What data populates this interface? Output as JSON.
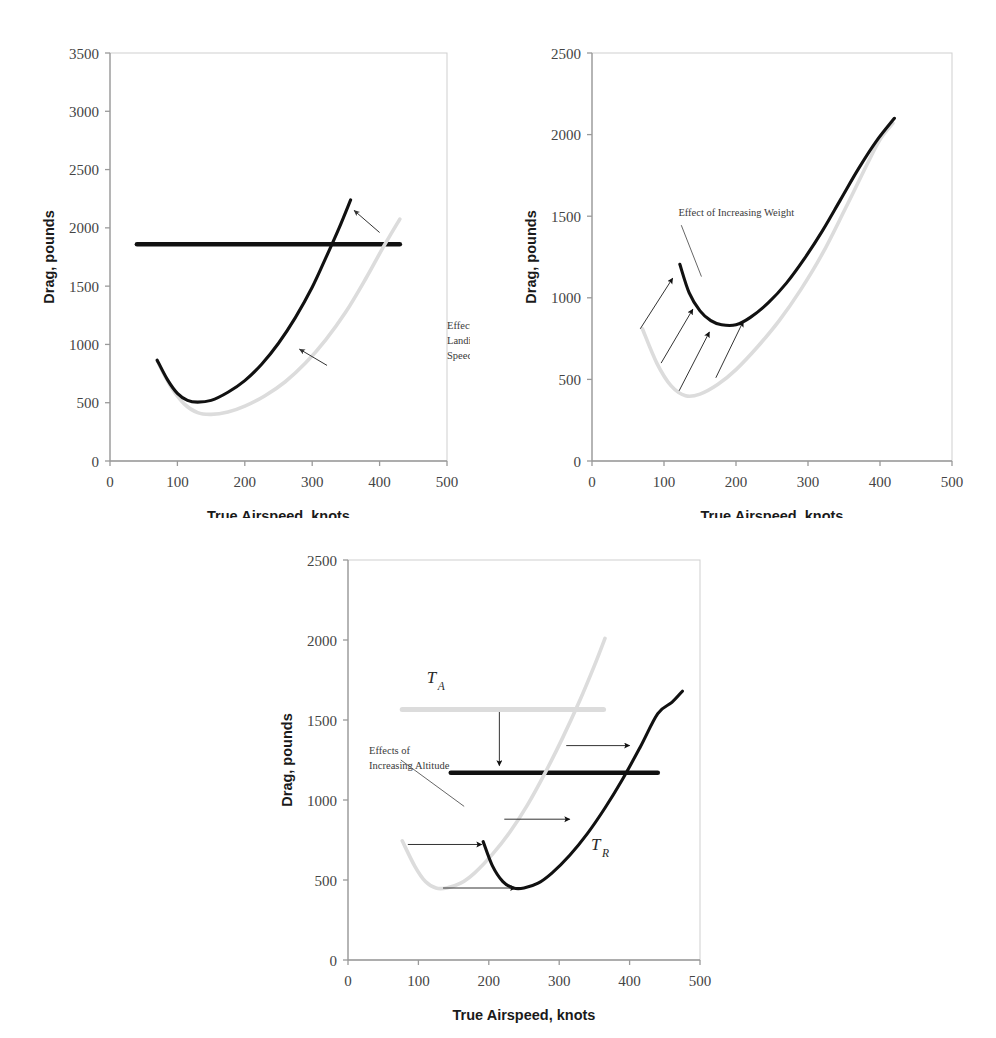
{
  "figure": {
    "background": "#ffffff",
    "colors": {
      "curve_dark": "#111111",
      "curve_light": "#dcdcdc",
      "axis": "#9a9a9a",
      "text": "#3a3a3a",
      "arrow": "#333333"
    }
  },
  "chart_data": [
    {
      "id": "chart-landing-gear",
      "type": "line",
      "title": "",
      "xlabel": "True Airspeed, knots",
      "ylabel": "Drag, pounds",
      "xlim": [
        0,
        500
      ],
      "ylim": [
        0,
        3500
      ],
      "xticks": [
        0,
        100,
        200,
        300,
        400,
        500
      ],
      "yticks": [
        0,
        500,
        1000,
        1500,
        2000,
        2500,
        3000,
        3500
      ],
      "grid": false,
      "legend": "none",
      "series": [
        {
          "name": "Thrust available (horizontal line)",
          "style": "dark-thick-horizontal",
          "x": [
            40,
            430
          ],
          "y": [
            1860,
            1860
          ]
        },
        {
          "name": "Drag, clean configuration",
          "style": "light",
          "x": [
            70,
            90,
            110,
            130,
            150,
            175,
            200,
            230,
            260,
            290,
            320,
            350,
            380,
            405,
            430
          ],
          "y": [
            860,
            640,
            490,
            415,
            400,
            420,
            470,
            560,
            680,
            840,
            1040,
            1280,
            1570,
            1830,
            2075
          ]
        },
        {
          "name": "Drag, gear or speed brakes extended",
          "style": "dark",
          "x": [
            70,
            85,
            100,
            115,
            130,
            150,
            175,
            200,
            225,
            250,
            275,
            300,
            320,
            340,
            357
          ],
          "y": [
            865,
            700,
            580,
            520,
            505,
            520,
            590,
            690,
            830,
            1010,
            1230,
            1490,
            1740,
            2000,
            2240
          ]
        }
      ],
      "annotations": [
        {
          "name": "effect-note",
          "text_lines": [
            "Effect of Extending",
            "Landing Gear or",
            "Speed Brakes"
          ],
          "x": 500,
          "y": 1130
        }
      ],
      "arrows": [
        {
          "name": "arrow-upper",
          "from_x": 400,
          "from_y": 1960,
          "to_x": 362,
          "to_y": 2150
        },
        {
          "name": "arrow-lower",
          "from_x": 322,
          "from_y": 820,
          "to_x": 281,
          "to_y": 960
        }
      ]
    },
    {
      "id": "chart-increasing-weight",
      "type": "line",
      "title": "",
      "xlabel": "True Airspeed, knots",
      "ylabel": "Drag, pounds",
      "xlim": [
        0,
        500
      ],
      "ylim": [
        0,
        2500
      ],
      "xticks": [
        0,
        100,
        200,
        300,
        400,
        500
      ],
      "yticks": [
        0,
        500,
        1000,
        1500,
        2000,
        2500
      ],
      "grid": false,
      "legend": "none",
      "series": [
        {
          "name": "Drag, lower weight",
          "style": "light",
          "x": [
            70,
            90,
            110,
            130,
            150,
            175,
            200,
            230,
            260,
            290,
            320,
            350,
            380,
            400,
            418
          ],
          "y": [
            810,
            600,
            460,
            400,
            410,
            470,
            560,
            700,
            860,
            1050,
            1270,
            1530,
            1800,
            1970,
            2070
          ]
        },
        {
          "name": "Drag, higher weight",
          "style": "dark",
          "x": [
            122,
            135,
            150,
            165,
            180,
            200,
            220,
            245,
            270,
            295,
            320,
            345,
            370,
            395,
            420
          ],
          "y": [
            1205,
            1030,
            920,
            860,
            835,
            835,
            880,
            970,
            1090,
            1240,
            1410,
            1600,
            1790,
            1960,
            2100
          ]
        }
      ],
      "annotations": [
        {
          "name": "effect-note",
          "text_lines": [
            "Effect of Increasing Weight"
          ],
          "x": 120,
          "y": 1500
        }
      ],
      "arrows": [
        {
          "name": "weight-arrow-1",
          "from_x": 67,
          "from_y": 810,
          "to_x": 112,
          "to_y": 1120
        },
        {
          "name": "weight-arrow-2",
          "from_x": 96,
          "from_y": 600,
          "to_x": 140,
          "to_y": 930
        },
        {
          "name": "weight-arrow-3",
          "from_x": 121,
          "from_y": 430,
          "to_x": 163,
          "to_y": 790
        },
        {
          "name": "weight-arrow-4",
          "from_x": 172,
          "from_y": 510,
          "to_x": 210,
          "to_y": 855
        },
        {
          "name": "leader-line",
          "from_x": 124,
          "from_y": 1445,
          "to_x": 152,
          "to_y": 1130
        }
      ]
    },
    {
      "id": "chart-increasing-altitude",
      "type": "line",
      "title": "",
      "xlabel": "True Airspeed, knots",
      "ylabel": "Drag, pounds",
      "xlim": [
        0,
        500
      ],
      "ylim": [
        0,
        2500
      ],
      "xticks": [
        0,
        100,
        200,
        300,
        400,
        500
      ],
      "yticks": [
        0,
        500,
        1000,
        1500,
        2000,
        2500
      ],
      "grid": false,
      "legend": "none",
      "series": [
        {
          "name": "Thrust available, sea level",
          "style": "light-thick-horizontal",
          "x": [
            77,
            363
          ],
          "y": [
            1565,
            1565
          ]
        },
        {
          "name": "Thrust available, altitude",
          "style": "dark-thick-horizontal",
          "x": [
            146,
            440
          ],
          "y": [
            1170,
            1170
          ]
        },
        {
          "name": "Thrust required, sea level",
          "style": "light",
          "x": [
            77,
            95,
            110,
            125,
            140,
            160,
            180,
            205,
            230,
            255,
            280,
            305,
            330,
            350,
            365
          ],
          "y": [
            745,
            585,
            490,
            450,
            450,
            480,
            545,
            660,
            800,
            970,
            1170,
            1390,
            1630,
            1840,
            2010
          ]
        },
        {
          "name": "Thrust required, altitude",
          "style": "dark",
          "x": [
            192,
            205,
            220,
            235,
            250,
            270,
            290,
            315,
            340,
            365,
            390,
            415,
            440,
            460,
            475
          ],
          "y": [
            740,
            590,
            490,
            450,
            450,
            480,
            545,
            655,
            790,
            950,
            1130,
            1330,
            1540,
            1610,
            1680
          ]
        }
      ],
      "annotations": [
        {
          "name": "curve-label-TA",
          "text": "T",
          "subscript": "A",
          "x": 112,
          "y": 1730
        },
        {
          "name": "curve-label-TR",
          "text": "T",
          "subscript": "R",
          "x": 345,
          "y": 690
        },
        {
          "name": "effect-note",
          "text_lines": [
            "Effects of",
            "Increasing Altitude"
          ],
          "x": 30,
          "y": 1290
        }
      ],
      "arrows": [
        {
          "name": "altitude-arrow-down",
          "from_x": 215,
          "from_y": 1550,
          "to_x": 215,
          "to_y": 1215
        },
        {
          "name": "altitude-arrow-top",
          "from_x": 310,
          "from_y": 1340,
          "to_x": 400,
          "to_y": 1340
        },
        {
          "name": "altitude-arrow-mid",
          "from_x": 222,
          "from_y": 880,
          "to_x": 315,
          "to_y": 880
        },
        {
          "name": "altitude-arrow-low",
          "from_x": 85,
          "from_y": 722,
          "to_x": 190,
          "to_y": 722
        },
        {
          "name": "altitude-arrow-bottom",
          "from_x": 135,
          "from_y": 450,
          "to_x": 238,
          "to_y": 450
        },
        {
          "name": "leader-line",
          "from_x": 75,
          "from_y": 1250,
          "to_x": 165,
          "to_y": 960
        }
      ]
    }
  ]
}
